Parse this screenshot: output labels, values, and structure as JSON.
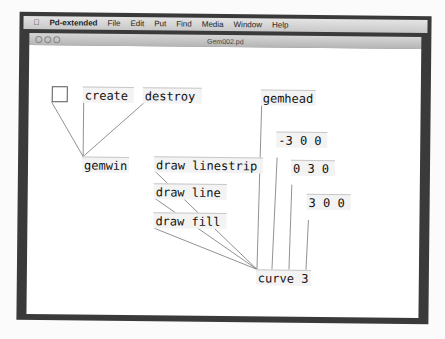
{
  "menubar": {
    "apple": "apple-icon",
    "app": "Pd-extended",
    "items": [
      "File",
      "Edit",
      "Put",
      "Find",
      "Media",
      "Window",
      "Help"
    ]
  },
  "window": {
    "title": "Gem002.pd"
  },
  "patch": {
    "objects": {
      "create": "create",
      "destroy": "destroy",
      "gemwin": "gemwin",
      "gemhead": "gemhead",
      "m1": "-3 0 0",
      "m2": "0 3 0",
      "m3": "3 0 0",
      "linestrip": "draw linestrip",
      "line": "draw line",
      "fill": "draw fill",
      "curve": "curve 3"
    }
  }
}
